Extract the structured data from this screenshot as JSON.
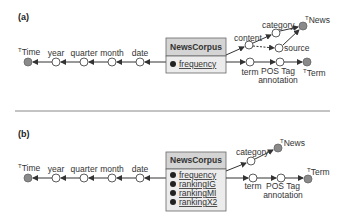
{
  "panels": [
    {
      "label": "(a)",
      "fact": {
        "name": "NewsCorpus",
        "measures": [
          "frequency"
        ]
      },
      "time_hierarchy": {
        "top": {
          "sup": "T",
          "name": "Time"
        },
        "levels": [
          "year",
          "quarter",
          "month",
          "date"
        ]
      },
      "news_hierarchy": {
        "top": {
          "sup": "T",
          "name": "News"
        },
        "levels": [
          "content",
          "category",
          "source"
        ]
      },
      "term_hierarchy": {
        "top": {
          "sup": "T",
          "name": "Term"
        },
        "levels": [
          "term",
          "POS Tag",
          "annotation"
        ]
      }
    },
    {
      "label": "(b)",
      "fact": {
        "name": "NewsCorpus",
        "measures": [
          "frequency",
          "rankingIG",
          "rankingMI",
          "rankingX2"
        ]
      },
      "time_hierarchy": {
        "top": {
          "sup": "T",
          "name": "Time"
        },
        "levels": [
          "year",
          "quarter",
          "month",
          "date"
        ]
      },
      "news_hierarchy": {
        "top": {
          "sup": "T",
          "name": "News"
        },
        "levels": [
          "category"
        ]
      },
      "term_hierarchy": {
        "top": {
          "sup": "T",
          "name": "Term"
        },
        "levels": [
          "term",
          "POS Tag",
          "annotation"
        ]
      }
    }
  ],
  "colors": {
    "box_header": "#d4d4d4",
    "box_body": "#ececec",
    "top_node": "#8a8a8a",
    "edge": "#333333"
  }
}
